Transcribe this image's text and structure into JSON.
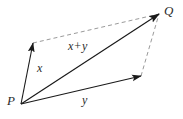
{
  "figure": {
    "width": 183,
    "height": 119,
    "background_color": "#ffffff",
    "stroke_color": "#1a1a1a",
    "dashed_color": "#9a9a9a",
    "label_color": "#2b2b2b"
  },
  "points": [
    {
      "id": "P",
      "label": "P",
      "x": 21,
      "y": 104,
      "label_x": 7,
      "label_y": 94
    },
    {
      "id": "Q",
      "label": "Q",
      "x": 159,
      "y": 14,
      "label_x": 164,
      "label_y": 4
    }
  ],
  "vectors": [
    {
      "id": "x",
      "label": "x",
      "from": {
        "x": 21,
        "y": 104
      },
      "to": {
        "x": 33,
        "y": 43
      },
      "style": "solid",
      "arrow": true,
      "label_x": 37,
      "label_y": 62
    },
    {
      "id": "y",
      "label": "y",
      "from": {
        "x": 21,
        "y": 104
      },
      "to": {
        "x": 141,
        "y": 76
      },
      "style": "solid",
      "arrow": true,
      "label_x": 82,
      "label_y": 94
    },
    {
      "id": "x+y",
      "label_first": "x",
      "label_op": "+",
      "label_second": "y",
      "from": {
        "x": 21,
        "y": 104
      },
      "to": {
        "x": 159,
        "y": 14
      },
      "style": "solid",
      "arrow": true,
      "label_x": 68,
      "label_y": 40
    }
  ],
  "construction_lines": [
    {
      "id": "x-to-Q",
      "from": {
        "x": 33,
        "y": 43
      },
      "to": {
        "x": 159,
        "y": 14
      },
      "style": "dashed"
    },
    {
      "id": "y-to-Q",
      "from": {
        "x": 141,
        "y": 76
      },
      "to": {
        "x": 159,
        "y": 14
      },
      "style": "dashed"
    }
  ]
}
